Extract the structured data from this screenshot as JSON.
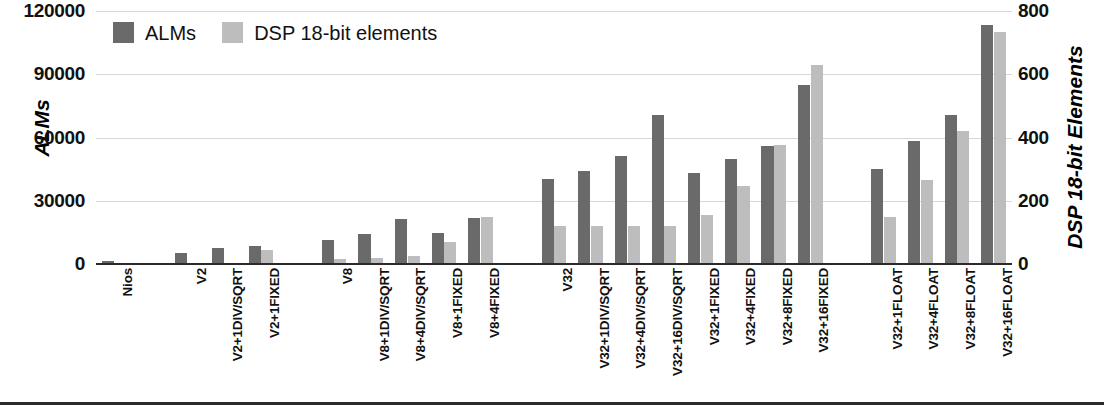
{
  "chart_data": {
    "type": "bar",
    "title": "",
    "subtitle": "",
    "ylabel": "ALMs",
    "y2label": "DSP 18-bit Elements",
    "xlabel": "",
    "ylim": [
      0,
      120000
    ],
    "y2lim": [
      0,
      800
    ],
    "yticks": [
      "0",
      "30000",
      "60000",
      "90000",
      "120000"
    ],
    "y2ticks": [
      "0",
      "200",
      "400",
      "600",
      "800"
    ],
    "grid": true,
    "legend_position": "top-left",
    "categories": [
      "Nios",
      "V2",
      "V2+1DIV/SQRT",
      "V2+1FIXED",
      "V8",
      "V8+1DIV/SQRT",
      "V8+4DIV/SQRT",
      "V8+1FIXED",
      "V8+4FIXED",
      "V32",
      "V32+1DIV/SQRT",
      "V32+4DIV/SQRT",
      "V32+16DIV/SQRT",
      "V32+1FIXED",
      "V32+4FIXED",
      "V32+8FIXED",
      "V32+16FIXED",
      "V32+1FLOAT",
      "V32+4FLOAT",
      "V32+8FLOAT",
      "V32+16FLOAT"
    ],
    "group_gaps_after": [
      0,
      3,
      8,
      16
    ],
    "series": [
      {
        "name": "ALMs",
        "axis": "left",
        "color": "#6a6a6a",
        "values": [
          1200,
          5200,
          7800,
          8600,
          11400,
          14300,
          21300,
          14800,
          21900,
          40400,
          43900,
          51400,
          70700,
          43100,
          50000,
          56100,
          85000,
          45300,
          58300,
          70500,
          113600
        ]
      },
      {
        "name": "DSP 18-bit elements",
        "axis": "right",
        "color": "#bdbdbd",
        "values": [
          2,
          4,
          4,
          44,
          16,
          20,
          24,
          70,
          150,
          120,
          120,
          120,
          120,
          155,
          247,
          375,
          630,
          150,
          267,
          420,
          735
        ]
      }
    ]
  },
  "legend": {
    "items": [
      {
        "label": "ALMs",
        "color": "#6a6a6a",
        "swatch": "legend-swatch-alms"
      },
      {
        "label": "DSP 18-bit elements",
        "color": "#bdbdbd",
        "swatch": "legend-swatch-dsp"
      }
    ]
  }
}
